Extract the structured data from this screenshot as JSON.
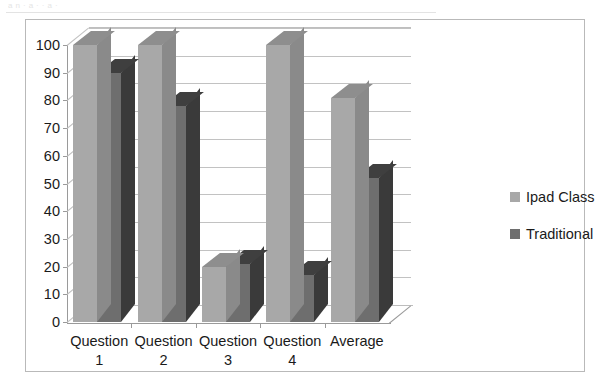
{
  "page": {
    "scan_artifact_text": "a  n  ·  a          ·  ·   a   ·"
  },
  "chart_data": {
    "type": "bar",
    "style": "3d-clustered-column",
    "title": "",
    "subtitle": "",
    "xlabel": "",
    "ylabel": "",
    "categories": [
      "Question 1",
      "Question 2",
      "Question 3",
      "Question 4",
      "Average"
    ],
    "category_lines": [
      [
        "Question",
        "1"
      ],
      [
        "Question",
        "2"
      ],
      [
        "Question",
        "3"
      ],
      [
        "Question",
        "4"
      ],
      [
        "Average",
        ""
      ]
    ],
    "series": [
      {
        "name": "Ipad Class",
        "color": "#a8a8a8",
        "values": [
          100,
          100,
          20,
          100,
          81
        ]
      },
      {
        "name": "Traditional",
        "color": "#6e6e6e",
        "values": [
          90,
          78,
          21,
          17,
          52
        ]
      }
    ],
    "ylim": [
      0,
      100
    ],
    "ytick_step": 10,
    "ytick_labels": [
      "100",
      "90",
      "80",
      "70",
      "60",
      "50",
      "40",
      "30",
      "20",
      "10",
      "0"
    ],
    "ytick_values": [
      100,
      90,
      80,
      70,
      60,
      50,
      40,
      30,
      20,
      10,
      0
    ],
    "grid": true,
    "grid_axis": "y",
    "legend_position": "right",
    "legend": [
      "Ipad Class",
      "Traditional"
    ],
    "colors": {
      "series_1": "#a8a8a8",
      "series_2": "#6e6e6e",
      "gridline": "#c2c2c2",
      "axis": "#9a9a9a",
      "frame": "#b9b9b9",
      "background": "#ffffff",
      "text": "#1a1a1a"
    }
  }
}
